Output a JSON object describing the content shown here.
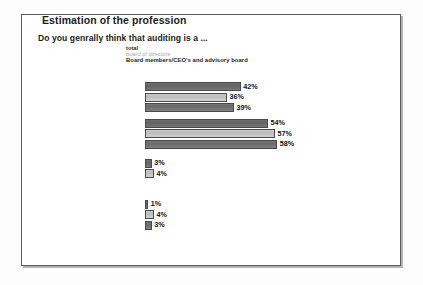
{
  "slide": {
    "title": "Estimation of the profession",
    "subtitle": "Do you genrally think that auditing is a  ..."
  },
  "legend": {
    "items": [
      {
        "label": "total",
        "color": "#6b6b6b"
      },
      {
        "label": "board of directors",
        "color": "#c4c4c4"
      },
      {
        "label": "Board members/CEO's and advisory board",
        "color": "#737373"
      }
    ]
  },
  "chart_data": {
    "type": "bar",
    "orientation": "horizontal",
    "title": "Estimation of the profession",
    "subtitle": "Do you genrally think that auditing is a  ...",
    "xlabel": "",
    "ylabel": "",
    "unit": "%",
    "grid": false,
    "legend_position": "top",
    "xlim": [
      0,
      60
    ],
    "categories": [
      "... modern profession, that has recognised the sign of the times",
      "... a profession, that has not yet recognised modern market requirements",
      "... a dated profession that has a limited future",
      "No answer"
    ],
    "category_lines": [
      [
        "... modern profession, that has",
        "recognised the sign of the times"
      ],
      [
        "... a profession, that has not",
        "yet recognised modern market",
        "requirements"
      ],
      [
        "... a dated profession",
        "that has a limited future"
      ],
      [
        "No answer"
      ]
    ],
    "series": [
      {
        "name": "total",
        "color": "#6b6b6b",
        "values": [
          42,
          54,
          3,
          1
        ],
        "labels": [
          "42%",
          "54%",
          "3%",
          "1%"
        ]
      },
      {
        "name": "board of directors",
        "color": "#c4c4c4",
        "values": [
          36,
          57,
          4,
          4
        ],
        "labels": [
          "36%",
          "57%",
          "4%",
          "4%"
        ]
      },
      {
        "name": "Board members/CEO's and advisory board",
        "color": "#737373",
        "values": [
          39,
          58,
          null,
          3
        ],
        "labels": [
          "39%",
          "58%",
          "",
          "3%"
        ]
      }
    ]
  }
}
